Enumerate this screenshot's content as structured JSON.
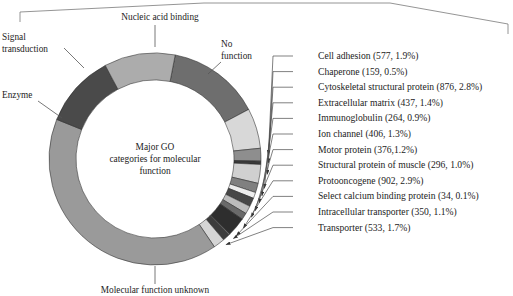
{
  "figure": {
    "center_text": [
      "Major GO",
      "categories for molecular",
      "function"
    ],
    "center_title": "Major GO categories for molecular function"
  },
  "outer_labels": [
    {
      "name": "nucleic-acid-binding",
      "text": "Nucleic acid binding"
    },
    {
      "name": "signal-transduction",
      "text_lines": [
        "Signal",
        "transduction"
      ]
    },
    {
      "name": "enzyme",
      "text": "Enzyme"
    },
    {
      "name": "no-function",
      "text_lines": [
        "No",
        "function"
      ]
    },
    {
      "name": "molecular-function-unknown",
      "text": "Molecular function unknown"
    }
  ],
  "side_labels": [
    {
      "name": "cell-adhesion",
      "text": "Cell adhesion (577, 1.9%)"
    },
    {
      "name": "chaperone",
      "text": "Chaperone (159, 0.5%)"
    },
    {
      "name": "cytoskeletal-structural-protein",
      "text": "Cytoskeletal structural protein (876, 2.8%)"
    },
    {
      "name": "extracellular-matrix",
      "text": "Extracellular matrix (437, 1.4%)"
    },
    {
      "name": "immunoglobulin",
      "text": "Immunoglobulin (264, 0.9%)"
    },
    {
      "name": "ion-channel",
      "text": "Ion channel (406, 1.3%)"
    },
    {
      "name": "motor-protein",
      "text": "Motor protein (376,1.2%)"
    },
    {
      "name": "structural-protein-of-muscle",
      "text": "Structural protein of muscle (296, 1.0%)"
    },
    {
      "name": "protooncogene",
      "text": "Protooncogene (902, 2.9%)"
    },
    {
      "name": "select-calcium-binding-protein",
      "text": "Select calcium binding protein (34, 0.1%)"
    },
    {
      "name": "intracellular-transporter",
      "text": "Intracellular transporter (350, 1.1%)"
    },
    {
      "name": "transporter",
      "text": "Transporter (533, 1.7%)"
    }
  ],
  "chart_data": {
    "type": "pie",
    "variant": "donut",
    "title": "Major GO categories for molecular function",
    "value_unit": "genes",
    "center": {
      "cx": 155,
      "cy": 159,
      "r_outer": 106,
      "r_inner": 79
    },
    "start_angle_deg": -79,
    "direction": "clockwise",
    "legend": "leader-lines",
    "labels": [
      "Nucleic acid binding",
      "No function",
      "Cell adhesion",
      "Chaperone",
      "Cytoskeletal structural protein",
      "Extracellular matrix",
      "Immunoglobulin",
      "Ion channel",
      "Motor protein",
      "Structural protein of muscle",
      "Protooncogene",
      "Select calcium binding protein",
      "Intracellular transporter",
      "Transporter",
      "Molecular function unknown",
      "Enzyme",
      "Signal transduction"
    ],
    "values": [
      4350,
      1880,
      577,
      159,
      876,
      437,
      264,
      406,
      376,
      296,
      902,
      34,
      350,
      533,
      12400,
      3400,
      3300
    ],
    "percentages": [
      13.9,
      6.0,
      1.9,
      0.5,
      2.8,
      1.4,
      0.9,
      1.3,
      1.2,
      1.0,
      2.9,
      0.1,
      1.1,
      1.7,
      39.7,
      10.9,
      10.6
    ],
    "colors": [
      "#6e6e6e",
      "#d8d8d8",
      "#8e8e8e",
      "#3a3a3a",
      "#d0d0d0",
      "#808080",
      "#ededed",
      "#474747",
      "#bdbdbd",
      "#6a6a6a",
      "#2e2e2e",
      "#e8e8e8",
      "#3c3c3c",
      "#d5d5d5",
      "#9a9a9a",
      "#4a4a4a",
      "#acacac"
    ],
    "slices": [
      {
        "label": "Nucleic acid binding",
        "percent": 13.9,
        "color": "#6e6e6e",
        "count": null
      },
      {
        "label": "No function",
        "percent": 6.0,
        "color": "#d8d8d8",
        "count": null
      },
      {
        "label": "Cell adhesion",
        "percent": 1.9,
        "color": "#8e8e8e",
        "count": 577
      },
      {
        "label": "Chaperone",
        "percent": 0.5,
        "color": "#3a3a3a",
        "count": 159
      },
      {
        "label": "Cytoskeletal structural protein",
        "percent": 2.8,
        "color": "#d0d0d0",
        "count": 876
      },
      {
        "label": "Extracellular matrix",
        "percent": 1.4,
        "color": "#808080",
        "count": 437
      },
      {
        "label": "Immunoglobulin",
        "percent": 0.9,
        "color": "#ededed",
        "count": 264
      },
      {
        "label": "Ion channel",
        "percent": 1.3,
        "color": "#474747",
        "count": 406
      },
      {
        "label": "Motor protein",
        "percent": 1.2,
        "color": "#bdbdbd",
        "count": 376
      },
      {
        "label": "Structural protein of muscle",
        "percent": 1.0,
        "color": "#6a6a6a",
        "count": 296
      },
      {
        "label": "Protooncogene",
        "percent": 2.9,
        "color": "#2e2e2e",
        "count": 902
      },
      {
        "label": "Select calcium binding protein",
        "percent": 0.1,
        "color": "#e8e8e8",
        "count": 34
      },
      {
        "label": "Intracellular transporter",
        "percent": 1.1,
        "color": "#3c3c3c",
        "count": 350
      },
      {
        "label": "Transporter",
        "percent": 1.7,
        "color": "#d5d5d5",
        "count": 533
      },
      {
        "label": "Molecular function unknown",
        "percent": 39.7,
        "color": "#9a9a9a",
        "count": null
      },
      {
        "label": "Enzyme",
        "percent": 10.9,
        "color": "#4a4a4a",
        "count": null
      },
      {
        "label": "Signal transduction",
        "percent": 10.6,
        "color": "#acacac",
        "count": null
      }
    ]
  }
}
